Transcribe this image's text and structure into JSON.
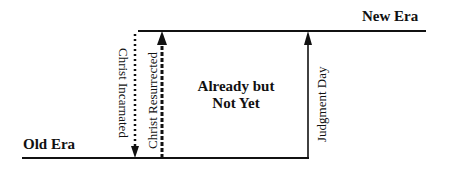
{
  "diagram": {
    "labels": {
      "old_era": "Old Era",
      "new_era": "New Era",
      "middle_line1": "Already but",
      "middle_line2": "Not Yet",
      "christ_incarnated": "Christ Incarnated",
      "christ_resurrected": "Christ Resurrected",
      "judgment_day": "Judgment Day"
    },
    "colors": {
      "line": "#111111",
      "background": "#ffffff"
    },
    "arrows": [
      {
        "label": "Christ Incarnated",
        "direction": "down",
        "style": "dotted"
      },
      {
        "label": "Christ Resurrected",
        "direction": "up",
        "style": "dashed-thick"
      },
      {
        "label": "Judgment Day",
        "direction": "up",
        "style": "solid"
      }
    ]
  }
}
